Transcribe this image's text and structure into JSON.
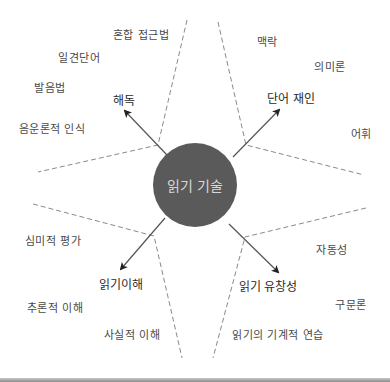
{
  "center": {
    "label": "읽기 기술",
    "fill": "#5a5a5a",
    "text_color": "#d8d8d8"
  },
  "quadrants": {
    "decoding": {
      "label": "해독",
      "items": [
        "혼합 접근법",
        "일견단어",
        "발음법",
        "음운론적 인식"
      ]
    },
    "word_recognition": {
      "label": "단어 재인",
      "items": [
        "맥락",
        "의미론",
        "어휘"
      ]
    },
    "comprehension": {
      "label": "읽기이해",
      "items": [
        "심미적 평가",
        "추론적 이해",
        "사실적 이해"
      ]
    },
    "fluency": {
      "label": "읽기 유창성",
      "items": [
        "자동성",
        "구문론",
        "읽기의 기계적 연습"
      ]
    }
  },
  "colors": {
    "dashed_line": "#8a8a8a",
    "arrow": "#555555",
    "main_label": "#2a2a2a",
    "sub_label": "#4a4a4a"
  }
}
